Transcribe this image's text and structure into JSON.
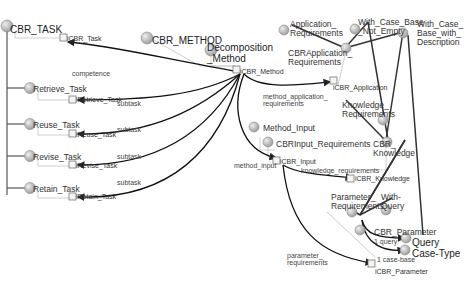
{
  "classes": [
    {
      "id": "cbr_task",
      "label": "CBR_TASK",
      "x": 10,
      "y": 25,
      "size": "big"
    },
    {
      "id": "retrieve_task",
      "label": "Retrieve_Task",
      "x": 33,
      "y": 85,
      "size": "mid"
    },
    {
      "id": "reuse_task",
      "label": "Reuse_Task",
      "x": 33,
      "y": 121,
      "size": "mid"
    },
    {
      "id": "revise_task",
      "label": "Revise_Task",
      "x": 33,
      "y": 153,
      "size": "mid"
    },
    {
      "id": "retain_task",
      "label": "Retain_Task",
      "x": 33,
      "y": 185,
      "size": "mid"
    },
    {
      "id": "cbr_method",
      "label": "CBR_METHOD",
      "x": 152,
      "y": 36,
      "size": "big"
    },
    {
      "id": "decomposition_method",
      "label": "Decomposition\n_Method",
      "x": 207,
      "y": 43,
      "size": "big"
    },
    {
      "id": "application_requirements",
      "label": "Application_\nRequirements",
      "x": 290,
      "y": 20,
      "size": "mid"
    },
    {
      "id": "with_case_base_not_empty",
      "label": "With_Case_Base\n_Not_Empty",
      "x": 358,
      "y": 18,
      "size": "mid"
    },
    {
      "id": "with_case_base_with_description",
      "label": "With_Case_\nBase_with_\nDescription",
      "x": 417,
      "y": 20,
      "size": "mid"
    },
    {
      "id": "cbrapplication_requirements",
      "label": "CBRApplication_\nRequirements",
      "x": 288,
      "y": 49,
      "size": "mid"
    },
    {
      "id": "knowledge_requirements",
      "label": "Knowledge_\nRequirements",
      "x": 342,
      "y": 101,
      "size": "mid"
    },
    {
      "id": "cbr_knowledge",
      "label": "CBR_\nKnowledge",
      "x": 373,
      "y": 140,
      "size": "mid"
    },
    {
      "id": "method_input",
      "label": "Method_Input",
      "x": 263,
      "y": 124,
      "size": "mid"
    },
    {
      "id": "cbrinput_requirements",
      "label": "CBRInput_Requirements",
      "x": 276,
      "y": 140,
      "size": "mid"
    },
    {
      "id": "parameter_requirements",
      "label": "Parameter_\nRequirements",
      "x": 331,
      "y": 193,
      "size": "mid"
    },
    {
      "id": "with_query",
      "label": "With-\nQuery",
      "x": 381,
      "y": 193,
      "size": "mid"
    },
    {
      "id": "cbr_parameter",
      "label": "CBR_Parameter",
      "x": 374,
      "y": 228,
      "size": "mid"
    },
    {
      "id": "query",
      "label": "Query",
      "x": 412,
      "y": 238,
      "size": "big"
    },
    {
      "id": "case_type",
      "label": "Case-Type",
      "x": 412,
      "y": 249,
      "size": "big"
    }
  ],
  "instances": [
    {
      "id": "icbr_task",
      "label": "iCBR_Task",
      "x": 67,
      "y": 35
    },
    {
      "id": "icbr_retrieve_task",
      "label": "iRetrieve_Task",
      "x": 76,
      "y": 96
    },
    {
      "id": "icbr_reuse_task",
      "label": "iReuse_Task",
      "x": 76,
      "y": 131
    },
    {
      "id": "icbr_revise_task",
      "label": "iRevise_Task",
      "x": 76,
      "y": 162
    },
    {
      "id": "icbr_retain_task",
      "label": "iRetain_Task",
      "x": 76,
      "y": 193
    },
    {
      "id": "icbr_method",
      "label": "iCBR_Method",
      "x": 240,
      "y": 68
    },
    {
      "id": "icbr_application",
      "label": "iCBR_Application",
      "x": 333,
      "y": 84
    },
    {
      "id": "icbr_input",
      "label": "iCBR_Input",
      "x": 280,
      "y": 158
    },
    {
      "id": "icbr_knowledge",
      "label": "iCBR_Knowledge",
      "x": 355,
      "y": 175
    },
    {
      "id": "icbr_parameter",
      "label": "iCBR_Parameter",
      "x": 375,
      "y": 268
    }
  ],
  "edge_labels": [
    {
      "label": "competence",
      "x": 72,
      "y": 70
    },
    {
      "label": "subtask",
      "x": 117,
      "y": 100
    },
    {
      "label": "subtask",
      "x": 117,
      "y": 126
    },
    {
      "label": "subtask",
      "x": 117,
      "y": 153
    },
    {
      "label": "subtask",
      "x": 117,
      "y": 179
    },
    {
      "label": "method_application_\nrequirements",
      "x": 263,
      "y": 93
    },
    {
      "label": "method_input",
      "x": 234,
      "y": 162
    },
    {
      "label": "knowledge_requirements",
      "x": 301,
      "y": 167
    },
    {
      "label": "parameter_\nrequirements",
      "x": 287,
      "y": 252
    },
    {
      "label": "1 query",
      "x": 374,
      "y": 238
    },
    {
      "label": "1 case-base",
      "x": 377,
      "y": 256
    }
  ],
  "colors": {
    "node": "#b8b8b8",
    "node_stroke": "#888888",
    "edge": "#222222",
    "is_a": "#cfcfcf"
  }
}
